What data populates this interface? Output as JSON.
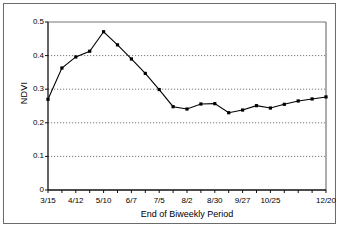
{
  "chart_data": {
    "type": "line",
    "title": "",
    "xlabel": "End of Biweekly Period",
    "ylabel": "NDVI",
    "ylim": [
      0,
      0.5
    ],
    "ytick_labels": [
      "0",
      "0.1",
      "0.2",
      "0.3",
      "0.4",
      "0.5"
    ],
    "ytick_values": [
      0,
      0.1,
      0.2,
      0.3,
      0.4,
      0.5
    ],
    "grid": "horizontal-dotted",
    "legend": "none",
    "marker": "filled-square",
    "line_color": "#000000",
    "categories": [
      "3/15",
      "3/29",
      "4/12",
      "4/26",
      "5/10",
      "5/24",
      "6/7",
      "6/21",
      "7/5",
      "7/19",
      "8/2",
      "8/16",
      "8/30",
      "9/13",
      "9/27",
      "10/11",
      "10/25",
      "11/8",
      "11/22",
      "12/6",
      "12/20"
    ],
    "xtick_labels_shown": [
      "3/15",
      "4/12",
      "5/10",
      "6/7",
      "7/5",
      "8/2",
      "8/30",
      "9/27",
      "10/25",
      "12/20"
    ],
    "values": [
      0.27,
      0.363,
      0.396,
      0.413,
      0.471,
      0.432,
      0.39,
      0.347,
      0.299,
      0.248,
      0.241,
      0.256,
      0.257,
      0.23,
      0.238,
      0.251,
      0.244,
      0.255,
      0.265,
      0.271,
      0.277
    ]
  }
}
